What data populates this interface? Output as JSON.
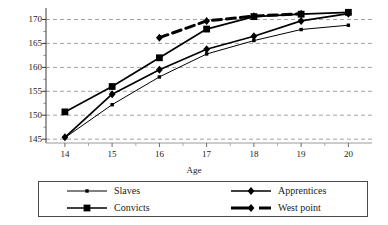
{
  "chart_data": {
    "type": "line",
    "title": "",
    "xlabel": "Age",
    "ylabel": "",
    "x": [
      14,
      15,
      16,
      17,
      18,
      19,
      20
    ],
    "xticklabels": [
      "14",
      "15",
      "16",
      "17",
      "18",
      "19",
      "20"
    ],
    "yticklabels": [
      "145",
      "150",
      "155",
      "160",
      "165",
      "170"
    ],
    "yticks": [
      145,
      150,
      155,
      160,
      165,
      170
    ],
    "xlim": [
      13.6,
      20.5
    ],
    "ylim": [
      144.2,
      172.4
    ],
    "grid": "horizontal-dashed",
    "legend_position": "bottom",
    "series": [
      {
        "name": "Slaves",
        "marker": "small-square",
        "linestyle": "solid",
        "linewidth": "thin",
        "color": "#000000",
        "x": [
          14,
          15,
          16,
          17,
          18,
          19,
          20
        ],
        "values": [
          145.3,
          152.2,
          158.0,
          162.8,
          165.6,
          167.9,
          168.8
        ]
      },
      {
        "name": "Convicts",
        "marker": "large-square",
        "linestyle": "solid",
        "linewidth": "medium",
        "color": "#000000",
        "x": [
          14,
          15,
          16,
          17,
          18,
          19,
          20
        ],
        "values": [
          150.7,
          156.0,
          162.0,
          168.0,
          170.6,
          171.1,
          171.5
        ]
      },
      {
        "name": "Apprentices",
        "marker": "diamond",
        "linestyle": "solid",
        "linewidth": "medium",
        "color": "#000000",
        "x": [
          14,
          15,
          16,
          17,
          18,
          19,
          20
        ],
        "values": [
          145.4,
          154.4,
          159.5,
          163.8,
          166.5,
          169.7,
          171.2
        ]
      },
      {
        "name": "West point",
        "marker": "diamond",
        "linestyle": "dashed",
        "linewidth": "thick",
        "color": "#000000",
        "x": [
          16,
          17,
          18,
          19
        ],
        "values": [
          166.2,
          169.7,
          170.7,
          171.2
        ]
      }
    ]
  },
  "legend": {
    "items": [
      {
        "label": "Slaves",
        "marker": "small-square",
        "linestyle": "solid"
      },
      {
        "label": "Apprentices",
        "marker": "diamond",
        "linestyle": "solid"
      },
      {
        "label": "Convicts",
        "marker": "large-square",
        "linestyle": "solid"
      },
      {
        "label": "West point",
        "marker": "diamond",
        "linestyle": "dashed"
      }
    ]
  }
}
